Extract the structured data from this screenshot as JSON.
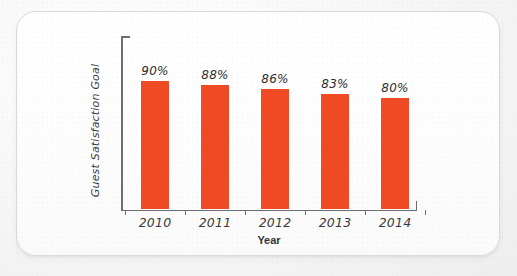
{
  "chart_data": {
    "type": "bar",
    "title": "",
    "subtitle": "",
    "xlabel": "Year",
    "ylabel": "Guest Satisfaction Goal",
    "categories": [
      "2010",
      "2011",
      "2012",
      "2013",
      "2014"
    ],
    "values": [
      90,
      88,
      86,
      83,
      80
    ],
    "value_labels": [
      "90%",
      "88%",
      "86%",
      "83%",
      "80%"
    ],
    "unit": "%",
    "series": [
      {
        "name": "Guest Satisfaction Goal",
        "values": [
          90,
          88,
          86,
          83,
          80
        ],
        "color": "#ef4a23"
      }
    ],
    "ylim": [
      0,
      100
    ],
    "axis_truncated": true,
    "y_tick_labels": [],
    "grid": false,
    "legend": false,
    "legend_position": "none",
    "annotations": []
  },
  "style": {
    "bar_color": "#ef4a23",
    "axis_color": "#6e6e70",
    "text_color": "#3a3a3c",
    "card_background": "#ffffff",
    "card_border": "#d9dada",
    "page_background": "#f2f2f2"
  },
  "layout": {
    "bar_px_tops": [
      69,
      73,
      77,
      82,
      86
    ],
    "baseline_px": 197,
    "bar_width_px": 28,
    "category_pitch_px": 60
  }
}
